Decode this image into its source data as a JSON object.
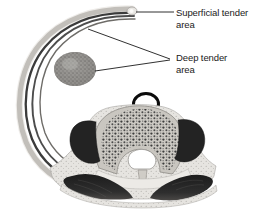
{
  "figure": {
    "background_color": "#ffffff"
  },
  "labels": {
    "superficial": {
      "line1": "Superficial tender",
      "line2": "area",
      "name": "superficial-tender-area-label"
    },
    "deep": {
      "line1": "Deep tender",
      "line2": "area",
      "name": "deep-tender-area-label"
    }
  },
  "anatomy": {
    "rib": {
      "name": "rib-curve",
      "description": "curved rib shaft",
      "cortex_color": "#d8d6d2",
      "marrow_color": "#3a3a3a"
    },
    "deep_tender_spot": {
      "name": "deep-tender-stipple-ellipse",
      "fill_color": "#8c8c8c"
    },
    "marker_ring": {
      "name": "black-marker-ring",
      "stroke_color": "#0a0a0a"
    },
    "vertebra": {
      "name": "vertebra-cross-section",
      "body_color": "#c9c6c0",
      "trabecula_color": "#3d3d3d",
      "foramen_color": "#ffffff",
      "transverse_process_color": "#2a2a2a"
    },
    "paraspinal_muscle": {
      "name": "paraspinal-muscle-mass",
      "fill_color": "#262626"
    },
    "fascia": {
      "name": "fascia-border",
      "fill_color": "#e2e0dc"
    }
  },
  "leader_lines": {
    "superficial": {
      "name": "leader-line-superficial",
      "color": "#1a1a1a"
    },
    "deep_upper": {
      "name": "leader-line-deep-upper",
      "color": "#1a1a1a"
    },
    "deep_lower": {
      "name": "leader-line-deep-lower",
      "color": "#1a1a1a"
    }
  }
}
